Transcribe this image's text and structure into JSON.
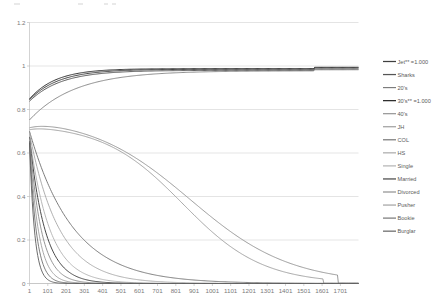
{
  "chart_data": {
    "type": "line",
    "title": "",
    "subtitle": "",
    "xlabel": "",
    "ylabel": "",
    "xlim": [
      1,
      1800
    ],
    "ylim": [
      0,
      1.2
    ],
    "grid": true,
    "legend_position": "right",
    "y_ticks": [
      "0",
      "0.2",
      "0.4",
      "0.6",
      "0.8",
      "1",
      "1.2"
    ],
    "y_tick_values": [
      0,
      0.2,
      0.4,
      0.6,
      0.8,
      1,
      1.2
    ],
    "x_ticks": [
      "1",
      "101",
      "201",
      "301",
      "401",
      "501",
      "601",
      "701",
      "801",
      "901",
      "1001",
      "1101",
      "1201",
      "1301",
      "1401",
      "1501",
      "1601",
      "1701"
    ],
    "x_tick_values": [
      1,
      101,
      201,
      301,
      401,
      501,
      601,
      701,
      801,
      901,
      1001,
      1101,
      1201,
      1301,
      1401,
      1501,
      1601,
      1701
    ],
    "series": [
      {
        "name": "Jet** =1.000",
        "color": "#3f3f3f",
        "width": 1.0,
        "kind": "rise",
        "start": 0.845,
        "asymptote": 0.985,
        "rate": 0.0062,
        "step_x": 1560,
        "step_delta": 0.006
      },
      {
        "name": "Sharks",
        "color": "#555555",
        "width": 1.0,
        "kind": "rise",
        "start": 0.838,
        "asymptote": 0.98,
        "rate": 0.0058,
        "step_x": 1560,
        "step_delta": 0.006
      },
      {
        "name": "20's",
        "color": "#7d7d7d",
        "width": 0.9,
        "kind": "rise",
        "start": 0.752,
        "asymptote": 0.978,
        "rate": 0.004,
        "step_x": 1560,
        "step_delta": 0.005
      },
      {
        "name": "30's** =1.000",
        "color": "#2e2e2e",
        "width": 1.0,
        "kind": "rise",
        "start": 0.848,
        "asymptote": 0.988,
        "rate": 0.007,
        "step_x": 1560,
        "step_delta": 0.006
      },
      {
        "name": "40's",
        "color": "#8f8f8f",
        "width": 0.9,
        "kind": "hump",
        "start": 0.745,
        "peak": 0.772,
        "peak_x": 150,
        "rate": 0.0027,
        "end_x": 1690
      },
      {
        "name": "JH",
        "color": "#9a9a9a",
        "width": 0.9,
        "kind": "hump",
        "start": 0.722,
        "peak": 0.735,
        "peak_x": 95,
        "rate": 0.0034,
        "end_x": 1610
      },
      {
        "name": "COL",
        "color": "#6e6e6e",
        "width": 0.9,
        "kind": "decay",
        "start": 0.7,
        "rate": 0.0042
      },
      {
        "name": "HS",
        "color": "#a6a6a6",
        "width": 0.9,
        "kind": "decay",
        "start": 0.69,
        "rate": 0.0062
      },
      {
        "name": "Single",
        "color": "#b0b0b0",
        "width": 0.9,
        "kind": "decay",
        "start": 0.678,
        "rate": 0.009
      },
      {
        "name": "Married",
        "color": "#4a4a4a",
        "width": 1.0,
        "kind": "decay",
        "start": 0.672,
        "rate": 0.0118
      },
      {
        "name": "Divorced",
        "color": "#8a8a8a",
        "width": 0.9,
        "kind": "decay",
        "start": 0.668,
        "rate": 0.0155
      },
      {
        "name": "Pusher",
        "color": "#9e9e9e",
        "width": 0.9,
        "kind": "decay",
        "start": 0.662,
        "rate": 0.0205
      },
      {
        "name": "Bookie",
        "color": "#717171",
        "width": 0.9,
        "kind": "decay",
        "start": 0.655,
        "rate": 0.027
      },
      {
        "name": "Burglar",
        "color": "#5c5c5c",
        "width": 0.9,
        "kind": "decay",
        "start": 0.648,
        "rate": 0.036
      }
    ]
  }
}
